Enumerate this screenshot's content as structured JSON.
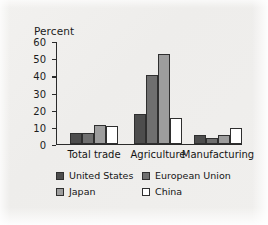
{
  "chart_data": {
    "type": "bar",
    "title": "",
    "xlabel": "",
    "ylabel": "Percent",
    "ylim": [
      0,
      60
    ],
    "yticks": [
      0,
      10,
      20,
      30,
      40,
      50,
      60
    ],
    "grid": false,
    "legend_position": "bottom",
    "categories": [
      "Total trade",
      "Agriculture",
      "Manufacturing"
    ],
    "series": [
      {
        "name": "United States",
        "color": "#4d4d4d",
        "values": [
          6,
          17,
          5
        ]
      },
      {
        "name": "European Union",
        "color": "#6f6f6f",
        "values": [
          6,
          40,
          3.5
        ]
      },
      {
        "name": "Japan",
        "color": "#9d9d9d",
        "values": [
          11,
          52,
          5
        ]
      },
      {
        "name": "China",
        "color": "#ffffff",
        "values": [
          10,
          15,
          9
        ]
      }
    ]
  },
  "axis": {
    "y_title": "Percent",
    "tick_labels": [
      "60",
      "50",
      "40",
      "30",
      "20",
      "10",
      "0"
    ]
  },
  "categories": {
    "c0": "Total trade",
    "c1": "Agriculture",
    "c2": "Manufacturing"
  },
  "legend": {
    "items": [
      {
        "label": "United States",
        "color": "#4d4d4d"
      },
      {
        "label": "European Union",
        "color": "#6f6f6f"
      },
      {
        "label": "Japan",
        "color": "#9d9d9d"
      },
      {
        "label": "China",
        "color": "#ffffff"
      }
    ]
  }
}
